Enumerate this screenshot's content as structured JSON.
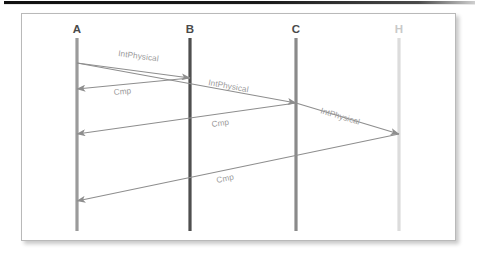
{
  "figure": {
    "type": "uml-sequence-diagram",
    "background": "#ffffff",
    "frame_border_color": "#b9b9b9",
    "arrow_color": "#8e8e8e",
    "label_color": "#9a9a9a"
  },
  "lifelines": [
    {
      "id": "A",
      "label": "A",
      "x": 55,
      "top": 24,
      "bottom": 217,
      "color": "#9b9b9b",
      "label_color": "#4a4a4a",
      "width": 3.2
    },
    {
      "id": "B",
      "label": "B",
      "x": 168,
      "top": 24,
      "bottom": 217,
      "color": "#4f4f4f",
      "label_color": "#4a4a4a",
      "width": 3.2
    },
    {
      "id": "C",
      "label": "C",
      "x": 274,
      "top": 24,
      "bottom": 217,
      "color": "#8a8a8a",
      "label_color": "#4a4a4a",
      "width": 3.2
    },
    {
      "id": "H",
      "label": "H",
      "x": 377,
      "top": 24,
      "bottom": 217,
      "color": "#dcdcdc",
      "label_color": "#c9c9c9",
      "width": 3.2
    }
  ],
  "messages": [
    {
      "id": "m1",
      "label": "IntPhysical",
      "from": "A",
      "to": "B",
      "x1": 55,
      "y1": 49,
      "x2": 168,
      "y2": 64,
      "label_x": 96,
      "label_y": 42,
      "label_rot": 7.6
    },
    {
      "id": "m2",
      "label": "Cmp",
      "from": "B",
      "to": "A",
      "x1": 168,
      "y1": 64,
      "x2": 55,
      "y2": 75,
      "label_x": 92,
      "label_y": 81,
      "label_rot": -5.6
    },
    {
      "id": "m3",
      "label": "IntPhysical",
      "from": "A",
      "to": "C",
      "x1": 55,
      "y1": 49,
      "x2": 274,
      "y2": 89,
      "label_x": 186,
      "label_y": 71,
      "label_rot": 10.4
    },
    {
      "id": "m4",
      "label": "Cmp",
      "from": "C",
      "to": "A",
      "x1": 274,
      "y1": 89,
      "x2": 55,
      "y2": 120,
      "label_x": 190,
      "label_y": 113,
      "label_rot": -8.1
    },
    {
      "id": "m5",
      "label": "IntPhysical",
      "from": "A",
      "to": "H",
      "x1": 274,
      "y1": 89,
      "x2": 377,
      "y2": 120,
      "label_x": 298,
      "label_y": 99,
      "label_rot": 16.8
    },
    {
      "id": "m6",
      "label": "Cmp",
      "from": "H",
      "to": "A",
      "x1": 377,
      "y1": 120,
      "x2": 55,
      "y2": 187,
      "label_x": 195,
      "label_y": 169,
      "label_rot": -11.8
    }
  ]
}
